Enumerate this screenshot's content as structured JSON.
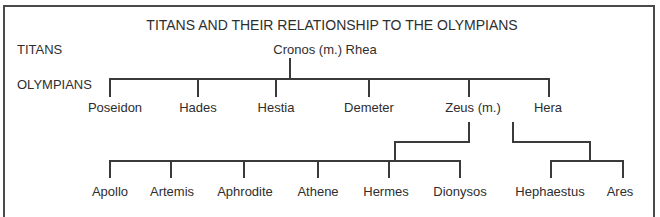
{
  "diagram": {
    "title": "TITANS AND THEIR RELATIONSHIP TO THE OLYMPIANS",
    "row_labels": {
      "titans": "TITANS",
      "olympians": "OLYMPIANS"
    },
    "titans": {
      "couple": "Cronos (m.) Rhea"
    },
    "olympians": [
      {
        "name": "Poseidon"
      },
      {
        "name": "Hades"
      },
      {
        "name": "Hestia"
      },
      {
        "name": "Demeter"
      },
      {
        "name": "Zeus (m.)"
      },
      {
        "name": "Hera"
      }
    ],
    "children_of_zeus": [
      {
        "name": "Apollo"
      },
      {
        "name": "Artemis"
      },
      {
        "name": "Aphrodite"
      },
      {
        "name": "Athene"
      },
      {
        "name": "Hermes"
      },
      {
        "name": "Dionysos"
      }
    ],
    "children_of_zeus_and_hera": [
      {
        "name": "Hephaestus"
      },
      {
        "name": "Ares"
      }
    ]
  }
}
